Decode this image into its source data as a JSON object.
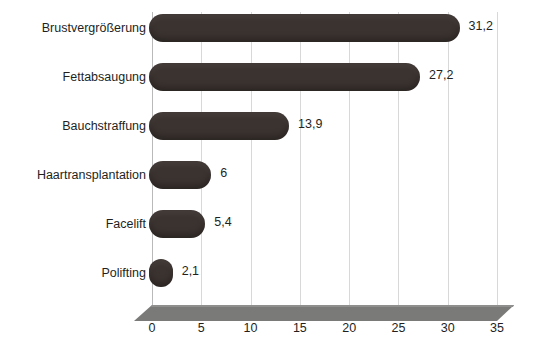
{
  "chart_data": {
    "type": "bar",
    "orientation": "horizontal",
    "title": "",
    "subtitle": "",
    "xlabel": "",
    "ylabel": "",
    "categories": [
      "Brustvergrößerung",
      "Fettabsaugung",
      "Bauchstraffung",
      "Haartransplantation",
      "Facelift",
      "Polifting"
    ],
    "values": [
      31.2,
      27.2,
      13.9,
      6,
      5.4,
      2.1
    ],
    "value_labels": [
      "31,2",
      "27,2",
      "13,9",
      "6",
      "5,4",
      "2,1"
    ],
    "xlim": [
      0,
      35
    ],
    "xticks": [
      0,
      5,
      10,
      15,
      20,
      25,
      30,
      35
    ],
    "xtick_labels": [
      "0",
      "5",
      "10",
      "15",
      "20",
      "25",
      "30",
      "35"
    ],
    "grid": true,
    "grid_axis": "x",
    "legend": "none",
    "decimal_separator": ",",
    "style": {
      "bar_color": "#3b3330",
      "grid_color": "#d8d8d8",
      "axis_color": "#b9b9b9",
      "floor_color": "#7a7a78",
      "text_color": "#231f1e",
      "background": "#ffffff",
      "bar_shape": "rounded-3d",
      "floor_effect": "3d-perspective-base"
    }
  }
}
